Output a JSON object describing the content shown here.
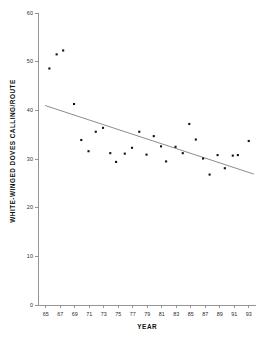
{
  "chart_data": {
    "type": "scatter",
    "title": "",
    "xlabel": "YEAR",
    "ylabel": "WHITE-WINGED DOVES CALLING/ROUTE",
    "xlim": [
      64,
      94
    ],
    "ylim": [
      0,
      60
    ],
    "grid": false,
    "legend": null,
    "xticks": [
      65,
      67,
      69,
      71,
      73,
      75,
      77,
      79,
      81,
      83,
      85,
      87,
      89,
      91,
      93
    ],
    "xtick_labels": [
      "65",
      "67",
      "69",
      "71",
      "73",
      "75",
      "77",
      "79",
      "81",
      "83",
      "85",
      "87",
      "89",
      "91",
      "93"
    ],
    "yticks": [
      0,
      10,
      20,
      30,
      40,
      50,
      60
    ],
    "ytick_labels": [
      "0",
      "10",
      "20",
      "30",
      "40",
      "50",
      "60"
    ],
    "marker": "square",
    "marker_color": "#111111",
    "points": [
      {
        "x": 65.5,
        "y": 48.6
      },
      {
        "x": 66.5,
        "y": 51.5
      },
      {
        "x": 67.4,
        "y": 52.3
      },
      {
        "x": 68.9,
        "y": 41.3
      },
      {
        "x": 69.9,
        "y": 33.9
      },
      {
        "x": 70.9,
        "y": 31.6
      },
      {
        "x": 71.9,
        "y": 35.6
      },
      {
        "x": 72.9,
        "y": 36.4
      },
      {
        "x": 73.9,
        "y": 31.2
      },
      {
        "x": 74.7,
        "y": 29.4
      },
      {
        "x": 75.9,
        "y": 31.1
      },
      {
        "x": 76.9,
        "y": 32.3
      },
      {
        "x": 77.9,
        "y": 35.6
      },
      {
        "x": 78.9,
        "y": 30.9
      },
      {
        "x": 79.9,
        "y": 34.7
      },
      {
        "x": 80.9,
        "y": 32.6
      },
      {
        "x": 81.6,
        "y": 29.5
      },
      {
        "x": 82.9,
        "y": 32.5
      },
      {
        "x": 83.9,
        "y": 31.2
      },
      {
        "x": 84.8,
        "y": 37.2
      },
      {
        "x": 85.7,
        "y": 34.0
      },
      {
        "x": 86.7,
        "y": 30.1
      },
      {
        "x": 87.6,
        "y": 26.8
      },
      {
        "x": 88.7,
        "y": 30.8
      },
      {
        "x": 89.7,
        "y": 28.1
      },
      {
        "x": 90.8,
        "y": 30.7
      },
      {
        "x": 91.5,
        "y": 30.8
      },
      {
        "x": 93.0,
        "y": 33.7
      }
    ],
    "trend_line": {
      "x_start": 64.9,
      "y_start": 41.0,
      "x_end": 93.7,
      "y_end": 26.9,
      "color": "#6e6e6e"
    }
  },
  "colors": {
    "background": "#ffffff",
    "axis": "#8a8a8a",
    "text": "#1a1a1a",
    "marker": "#111111",
    "trend": "#6e6e6e"
  }
}
